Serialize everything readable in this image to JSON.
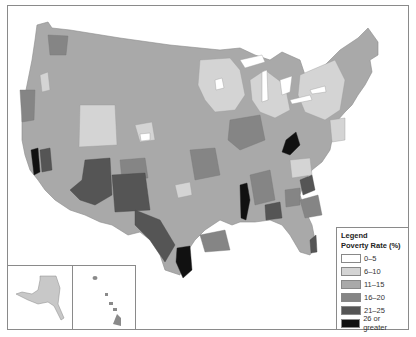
{
  "map": {
    "subject": "Poverty rate by region, United States",
    "insets": [
      "Alaska",
      "Hawaii"
    ]
  },
  "legend": {
    "title": "Legend",
    "subtitle": "Poverty Rate (%)",
    "items": [
      {
        "label": "0–5",
        "color": "#ffffff"
      },
      {
        "label": "6–10",
        "color": "#d4d4d4"
      },
      {
        "label": "11–15",
        "color": "#a9a9a9"
      },
      {
        "label": "16–20",
        "color": "#858585"
      },
      {
        "label": "21–25",
        "color": "#555555"
      },
      {
        "label": "26 or greater",
        "color": "#111111"
      }
    ]
  }
}
